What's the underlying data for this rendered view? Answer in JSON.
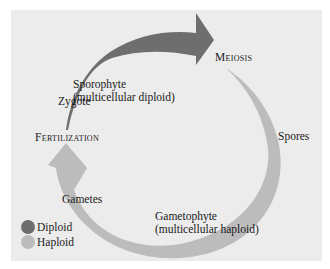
{
  "diagram": {
    "type": "life-cycle",
    "stages": {
      "sporophyte": "Sporophyte",
      "sporophyte_note": "(multicellular diploid)",
      "meiosis": "Meiosis",
      "spores": "Spores",
      "gametophyte": "Gametophyte",
      "gametophyte_note": "(multicellular haploid)",
      "gametes": "Gametes",
      "fertilization": "Fertilization",
      "zygote": "Zygote"
    },
    "arrows": [
      {
        "name": "diploid-phase-arrow",
        "from": "Fertilization",
        "to": "Meiosis",
        "phase": "Diploid"
      },
      {
        "name": "haploid-phase-arrow",
        "from": "Meiosis",
        "to": "Fertilization",
        "phase": "Haploid"
      }
    ]
  },
  "legend": {
    "items": [
      {
        "label": "Diploid",
        "color": "#6e6e6e"
      },
      {
        "label": "Haploid",
        "color": "#bcbcbc"
      }
    ]
  },
  "colors": {
    "background": "#ececec",
    "diploid": "#6e6e6e",
    "haploid": "#bcbcbc"
  }
}
